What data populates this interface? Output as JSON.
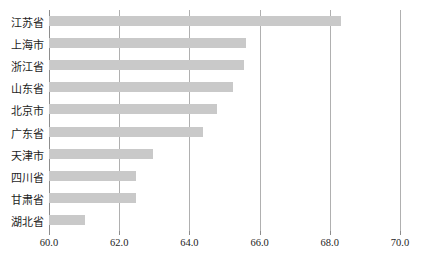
{
  "chart_data": {
    "type": "bar",
    "orientation": "horizontal",
    "title": "",
    "subtitle": "",
    "xlabel": "",
    "ylabel": "",
    "categories": [
      "江苏省",
      "上海市",
      "浙江省",
      "山东省",
      "北京市",
      "广东省",
      "天津市",
      "四川省",
      "甘肃省",
      "湖北省"
    ],
    "values": [
      68.33,
      65.6,
      65.55,
      65.24,
      64.79,
      64.39,
      62.96,
      62.49,
      62.48,
      61.03
    ],
    "xlim": [
      60.0,
      70.0
    ],
    "xticks": [
      60.0,
      62.0,
      64.0,
      66.0,
      68.0,
      70.0
    ],
    "xtick_labels": [
      "60.0",
      "62.0",
      "64.0",
      "66.0",
      "68.0",
      "70.0"
    ],
    "grid": "vertical",
    "legend": "none",
    "bar_color": "#c9c9c9",
    "gridline_color": "#b0b0b0",
    "axis_color": "#8d8d8d",
    "series": [
      {
        "name": "value",
        "points": [
          {
            "category": "江苏省",
            "value": 68.33
          },
          {
            "category": "上海市",
            "value": 65.6
          },
          {
            "category": "浙江省",
            "value": 65.55
          },
          {
            "category": "山东省",
            "value": 65.24
          },
          {
            "category": "北京市",
            "value": 64.79
          },
          {
            "category": "广东省",
            "value": 64.39
          },
          {
            "category": "天津市",
            "value": 62.96
          },
          {
            "category": "四川省",
            "value": 62.49
          },
          {
            "category": "甘肃省",
            "value": 62.48
          },
          {
            "category": "湖北省",
            "value": 61.03
          }
        ]
      }
    ]
  }
}
